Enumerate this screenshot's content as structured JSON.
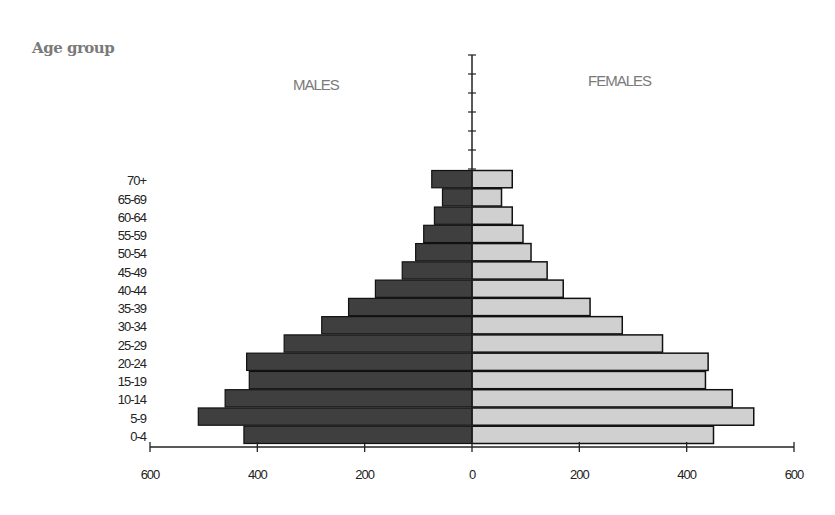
{
  "chart_data": {
    "type": "bar",
    "orientation": "horizontal-population-pyramid",
    "title": "",
    "ylabel": "Age group",
    "xlabel": "",
    "categories": [
      "0-4",
      "5-9",
      "10-14",
      "15-19",
      "20-24",
      "25-29",
      "30-34",
      "35-39",
      "40-44",
      "45-49",
      "50-54",
      "55-59",
      "60-64",
      "65-69",
      "70+"
    ],
    "series": [
      {
        "name": "MALES",
        "side": "left",
        "color": "#3f3f3f",
        "values": [
          425,
          510,
          460,
          415,
          420,
          350,
          280,
          230,
          180,
          130,
          105,
          90,
          70,
          55,
          75
        ]
      },
      {
        "name": "FEMALES",
        "side": "right",
        "color": "#d0d0d0",
        "values": [
          450,
          525,
          485,
          435,
          440,
          355,
          280,
          220,
          170,
          140,
          110,
          95,
          75,
          55,
          75
        ]
      }
    ],
    "xlim": [
      -600,
      600
    ],
    "xticks": [
      "600",
      "400",
      "200",
      "0",
      "200",
      "400",
      "600"
    ],
    "grid": false,
    "legend": "none (side labels MALES / FEMALES)"
  },
  "labels": {
    "y_title": "Age group",
    "males": "MALES",
    "females": "FEMALES"
  }
}
